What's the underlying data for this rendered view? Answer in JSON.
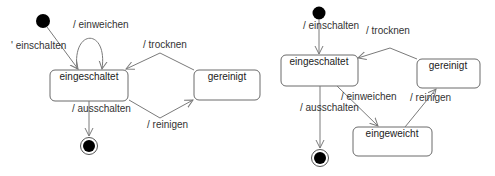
{
  "diagrams": [
    {
      "name": "simple",
      "states": {
        "eingeschaltet": "eingeschaltet",
        "gereinigt": "gereinigt"
      },
      "transitions": {
        "einschalten": "' einschalten",
        "einweichen": "/ einweichen",
        "trocknen": "/ trocknen",
        "reinigen": "/ reinigen",
        "ausschalten": "/ ausschalten"
      }
    },
    {
      "name": "extended",
      "states": {
        "eingeschaltet": "eingeschaltet",
        "gereinigt": "gereinigt",
        "eingeweicht": "eingeweicht"
      },
      "transitions": {
        "einschalten": "/ einschalten",
        "trocknen": "/ trocknen",
        "einweichen": "/ einweichen",
        "reinigen": "/ reinigen",
        "ausschalten": "/ ausschalten"
      }
    }
  ],
  "colors": {
    "node_fill": "#000000",
    "edge": "#7a7a7a",
    "state_border": "#6a6a6a"
  }
}
